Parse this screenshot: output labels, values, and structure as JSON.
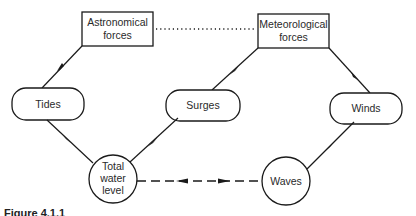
{
  "diagram": {
    "nodes": {
      "astronomical": {
        "line1": "Astronomical",
        "line2": "forces",
        "shape": "rectangle"
      },
      "meteorological": {
        "line1": "Meteorological",
        "line2": "forces",
        "shape": "rectangle"
      },
      "tides": {
        "label": "Tides",
        "shape": "rounded-rectangle"
      },
      "surges": {
        "label": "Surges",
        "shape": "rounded-rectangle"
      },
      "winds": {
        "label": "Winds",
        "shape": "rounded-rectangle"
      },
      "total_water_level": {
        "line1": "Total",
        "line2": "water",
        "line3": "level",
        "shape": "circle"
      },
      "waves": {
        "label": "Waves",
        "shape": "circle"
      }
    },
    "edges": [
      {
        "from": "Astronomical forces",
        "to": "Tides",
        "style": "solid-arrow"
      },
      {
        "from": "Meteorological forces",
        "to": "Surges",
        "style": "solid-arrow"
      },
      {
        "from": "Meteorological forces",
        "to": "Winds",
        "style": "solid-arrow"
      },
      {
        "from": "Tides",
        "to": "Total water level",
        "style": "solid-arrow"
      },
      {
        "from": "Surges",
        "to": "Total water level",
        "style": "solid-arrow"
      },
      {
        "from": "Winds",
        "to": "Waves",
        "style": "solid-arrow"
      },
      {
        "from": "Astronomical forces",
        "to": "Meteorological forces",
        "style": "dotted-line"
      },
      {
        "from": "Total water level",
        "to": "Waves",
        "style": "dashed-bidirectional-arrow"
      }
    ],
    "caption": "Figure 4.1.1"
  },
  "colors": {
    "stroke": "#1a1a1a",
    "text": "#2a2a2a",
    "background": "#ffffff"
  }
}
